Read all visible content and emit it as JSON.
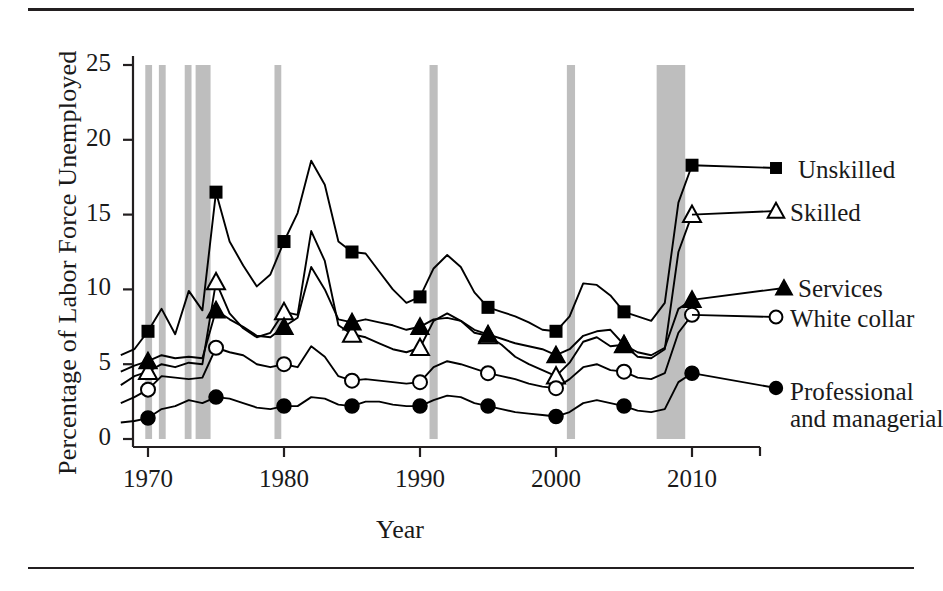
{
  "figure": {
    "has_top_rule": true,
    "has_bottom_rule": true
  },
  "chart_data": {
    "type": "line",
    "title": "",
    "xlabel": "Year",
    "ylabel": "Percentage of Labor Force Unemployed",
    "xlim": [
      1968,
      2011
    ],
    "ylim": [
      0,
      25.5
    ],
    "xticks": [
      1970,
      1980,
      1990,
      2000,
      2010
    ],
    "xtick_labels": [
      "1970",
      "1980",
      "1990",
      "2000",
      "2010"
    ],
    "yticks": [
      0,
      5,
      10,
      15,
      20,
      25
    ],
    "ytick_labels": [
      "0",
      "5",
      "10",
      "15",
      "20",
      "25"
    ],
    "grid": false,
    "legend_position": "right-inline-labels",
    "shaded_regions_label": "recession bands",
    "shaded_color": "#b3b3b3",
    "shaded_regions": [
      {
        "start": 1969.8,
        "end": 1970.3
      },
      {
        "start": 1970.8,
        "end": 1971.3
      },
      {
        "start": 1972.7,
        "end": 1973.2
      },
      {
        "start": 1973.5,
        "end": 1974.6
      },
      {
        "start": 1979.3,
        "end": 1979.8
      },
      {
        "start": 1990.7,
        "end": 1991.3
      },
      {
        "start": 2000.8,
        "end": 2001.4
      },
      {
        "start": 2007.4,
        "end": 2009.5
      }
    ],
    "marker_years": [
      1970,
      1975,
      1980,
      1985,
      1990,
      1995,
      2000,
      2005,
      2010
    ],
    "series": [
      {
        "name": "Unskilled",
        "marker": "filled-square",
        "color": "#000000",
        "x": [
          1968,
          1969,
          1970,
          1971,
          1972,
          1973,
          1974,
          1975,
          1976,
          1977,
          1978,
          1979,
          1980,
          1981,
          1982,
          1983,
          1984,
          1985,
          1986,
          1987,
          1988,
          1989,
          1990,
          1991,
          1992,
          1993,
          1994,
          1995,
          1996,
          1997,
          1998,
          1999,
          2000,
          2001,
          2002,
          2003,
          2004,
          2005,
          2006,
          2007,
          2008,
          2009,
          2010
        ],
        "y": [
          5.6,
          6.0,
          7.2,
          8.7,
          7.0,
          9.9,
          8.6,
          16.5,
          13.2,
          11.6,
          10.2,
          11.0,
          13.2,
          15.1,
          18.6,
          17.0,
          13.2,
          12.5,
          12.4,
          11.2,
          10.0,
          9.1,
          9.5,
          11.4,
          12.3,
          11.5,
          9.8,
          8.8,
          8.5,
          8.2,
          7.8,
          7.3,
          7.2,
          8.2,
          10.4,
          10.3,
          9.6,
          8.5,
          8.2,
          7.9,
          9.1,
          15.8,
          18.3
        ]
      },
      {
        "name": "Skilled",
        "marker": "open-triangle",
        "color": "#000000",
        "x": [
          1968,
          1969,
          1970,
          1971,
          1972,
          1973,
          1974,
          1975,
          1976,
          1977,
          1978,
          1979,
          1980,
          1981,
          1982,
          1983,
          1984,
          1985,
          1986,
          1987,
          1988,
          1989,
          1990,
          1991,
          1992,
          1993,
          1994,
          1995,
          1996,
          1997,
          1998,
          1999,
          2000,
          2001,
          2002,
          2003,
          2004,
          2005,
          2006,
          2007,
          2008,
          2009,
          2010
        ],
        "y": [
          3.6,
          4.2,
          4.5,
          5.0,
          4.8,
          5.1,
          5.0,
          10.5,
          8.4,
          7.4,
          6.8,
          7.1,
          8.5,
          8.3,
          13.9,
          11.9,
          7.6,
          7.0,
          6.8,
          6.4,
          6.0,
          5.8,
          6.1,
          7.9,
          8.4,
          7.9,
          7.1,
          6.9,
          6.3,
          5.5,
          5.0,
          4.6,
          4.2,
          5.1,
          6.5,
          6.8,
          6.2,
          6.3,
          5.5,
          5.4,
          6.0,
          12.5,
          15.0
        ]
      },
      {
        "name": "Services",
        "marker": "filled-triangle",
        "color": "#000000",
        "x": [
          1968,
          1969,
          1970,
          1971,
          1972,
          1973,
          1974,
          1975,
          1976,
          1977,
          1978,
          1979,
          1980,
          1981,
          1982,
          1983,
          1984,
          1985,
          1986,
          1987,
          1988,
          1989,
          1990,
          1991,
          1992,
          1993,
          1994,
          1995,
          1996,
          1997,
          1998,
          1999,
          2000,
          2001,
          2002,
          2003,
          2004,
          2005,
          2006,
          2007,
          2008,
          2009,
          2010
        ],
        "y": [
          4.5,
          4.9,
          5.2,
          5.6,
          5.4,
          5.5,
          5.4,
          8.6,
          8.0,
          7.5,
          6.9,
          6.8,
          7.5,
          8.1,
          11.5,
          10.0,
          8.0,
          7.8,
          8.0,
          7.8,
          7.6,
          7.3,
          7.5,
          8.0,
          8.1,
          7.9,
          7.3,
          7.0,
          6.7,
          6.4,
          6.2,
          6.0,
          5.6,
          6.0,
          6.9,
          7.2,
          7.3,
          6.3,
          5.8,
          5.6,
          6.1,
          8.7,
          9.3
        ]
      },
      {
        "name": "White collar",
        "marker": "open-circle",
        "color": "#000000",
        "x": [
          1968,
          1969,
          1970,
          1971,
          1972,
          1973,
          1974,
          1975,
          1976,
          1977,
          1978,
          1979,
          1980,
          1981,
          1982,
          1983,
          1984,
          1985,
          1986,
          1987,
          1988,
          1989,
          1990,
          1991,
          1992,
          1993,
          1994,
          1995,
          1996,
          1997,
          1998,
          1999,
          2000,
          2001,
          2002,
          2003,
          2004,
          2005,
          2006,
          2007,
          2008,
          2009,
          2010
        ],
        "y": [
          2.4,
          2.8,
          3.3,
          4.2,
          4.1,
          4.0,
          4.1,
          6.1,
          5.8,
          5.6,
          5.0,
          4.8,
          5.0,
          4.8,
          6.2,
          5.5,
          4.2,
          3.9,
          4.0,
          3.9,
          3.8,
          3.7,
          3.8,
          4.8,
          5.2,
          5.0,
          4.7,
          4.4,
          4.2,
          4.0,
          3.7,
          3.5,
          3.4,
          4.0,
          4.8,
          5.0,
          4.6,
          4.5,
          4.1,
          4.0,
          4.4,
          7.1,
          8.3
        ]
      },
      {
        "name": "Professional and managerial",
        "marker": "filled-circle",
        "color": "#000000",
        "x": [
          1968,
          1969,
          1970,
          1971,
          1972,
          1973,
          1974,
          1975,
          1976,
          1977,
          1978,
          1979,
          1980,
          1981,
          1982,
          1983,
          1984,
          1985,
          1986,
          1987,
          1988,
          1989,
          1990,
          1991,
          1992,
          1993,
          1994,
          1995,
          1996,
          1997,
          1998,
          1999,
          2000,
          2001,
          2002,
          2003,
          2004,
          2005,
          2006,
          2007,
          2008,
          2009,
          2010
        ],
        "y": [
          1.1,
          1.2,
          1.4,
          2.0,
          2.2,
          2.6,
          2.4,
          2.8,
          2.7,
          2.4,
          2.1,
          2.0,
          2.2,
          2.2,
          2.8,
          2.7,
          2.3,
          2.2,
          2.5,
          2.5,
          2.3,
          2.2,
          2.2,
          2.6,
          2.9,
          2.8,
          2.4,
          2.2,
          2.0,
          1.8,
          1.7,
          1.6,
          1.5,
          1.8,
          2.4,
          2.6,
          2.4,
          2.2,
          1.9,
          1.8,
          2.0,
          3.8,
          4.4
        ]
      }
    ]
  },
  "legend": {
    "items": [
      {
        "label": "Unskilled",
        "marker": "filled-square"
      },
      {
        "label": "Skilled",
        "marker": "open-triangle"
      },
      {
        "label": "Services",
        "marker": "filled-triangle"
      },
      {
        "label": "White collar",
        "marker": "open-circle"
      },
      {
        "label": "Professional",
        "label2": "and managerial",
        "marker": "filled-circle"
      }
    ]
  }
}
